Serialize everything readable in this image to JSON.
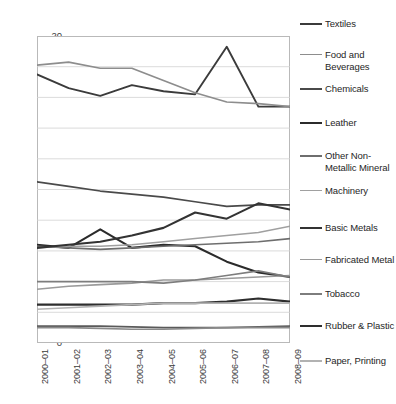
{
  "chart_data": {
    "type": "line",
    "title": "",
    "xlabel": "",
    "ylabel": "",
    "ylim": [
      0,
      20
    ],
    "ytick_step": 2,
    "grid": true,
    "legend_position": "right",
    "categories": [
      "2000–01",
      "2001–02",
      "2002–03",
      "2003–04",
      "2004–05",
      "2005–06",
      "2006–07",
      "2007–08",
      "2008–09"
    ],
    "yticks": [
      "0",
      "2",
      "4",
      "6",
      "8",
      "10",
      "12",
      "14",
      "16",
      "18",
      "20"
    ],
    "series": [
      {
        "name": "Textiles",
        "color": "#3b3b3b",
        "width": 1.9,
        "values": [
          17.5,
          16.6,
          16.1,
          16.8,
          16.4,
          16.2,
          19.3,
          15.4,
          15.4
        ]
      },
      {
        "name": "Food and Beverages",
        "color": "#8d8d8d",
        "width": 1.7,
        "values": [
          18.1,
          18.3,
          17.9,
          17.9,
          17.1,
          16.3,
          15.7,
          15.6,
          15.4
        ]
      },
      {
        "name": "Chemicals",
        "color": "#4a4a4a",
        "width": 1.7,
        "values": [
          10.5,
          10.2,
          9.9,
          9.7,
          9.5,
          9.2,
          8.9,
          9.0,
          9.0
        ]
      },
      {
        "name": "Leather",
        "color": "#2b2b2b",
        "width": 2.1,
        "values": [
          6.4,
          6.2,
          7.4,
          6.2,
          6.4,
          6.3,
          5.3,
          4.6,
          4.3
        ]
      },
      {
        "name": "Other Non-Metallic Mineral",
        "color": "#6e6e6e",
        "width": 1.6,
        "values": [
          6.3,
          6.2,
          6.1,
          6.2,
          6.3,
          6.4,
          6.5,
          6.6,
          6.8
        ]
      },
      {
        "name": "Machinery",
        "color": "#a0a0a0",
        "width": 1.5,
        "values": [
          6.2,
          6.3,
          6.3,
          6.4,
          6.6,
          6.8,
          7.0,
          7.2,
          7.6
        ]
      },
      {
        "name": "Basic Metals",
        "color": "#333333",
        "width": 2.1,
        "values": [
          6.2,
          6.4,
          6.6,
          7.0,
          7.5,
          8.5,
          8.1,
          9.1,
          8.7
        ]
      },
      {
        "name": "Fabricated Metal",
        "color": "#9a9a9a",
        "width": 1.6,
        "values": [
          3.5,
          3.7,
          3.8,
          3.9,
          4.1,
          4.1,
          4.2,
          4.3,
          4.4
        ]
      },
      {
        "name": "Tobacco",
        "color": "#7d7d7d",
        "width": 1.6,
        "values": [
          4.0,
          4.0,
          4.0,
          4.0,
          3.9,
          4.1,
          4.4,
          4.7,
          4.3
        ]
      },
      {
        "name": "Rubber & Plastic",
        "color": "#2e2e2e",
        "width": 2.2,
        "values": [
          2.5,
          2.5,
          2.5,
          2.5,
          2.6,
          2.6,
          2.7,
          2.9,
          2.7
        ]
      },
      {
        "name": "Paper, Printing",
        "color": "#b2b2b2",
        "width": 1.6,
        "values": [
          2.2,
          2.3,
          2.4,
          2.5,
          2.6,
          2.6,
          2.6,
          2.6,
          2.6
        ]
      },
      {
        "name": "Other 1",
        "color": "#5a5a5a",
        "width": 1.8,
        "values": [
          1.1,
          1.1,
          1.1,
          1.05,
          1.0,
          1.0,
          1.0,
          1.05,
          1.1
        ]
      },
      {
        "name": "Other 2",
        "color": "#8a8a8a",
        "width": 1.6,
        "values": [
          1.0,
          1.0,
          0.95,
          0.9,
          0.9,
          0.95,
          1.0,
          1.0,
          1.0
        ]
      }
    ],
    "legend_entries": [
      {
        "label": "Textiles",
        "color": "#3b3b3b",
        "width": 2.4,
        "top": 18
      },
      {
        "label": "Food and Beverages",
        "color": "#8d8d8d",
        "width": 1.8,
        "top": 49
      },
      {
        "label": "Chemicals",
        "color": "#4a4a4a",
        "width": 2.2,
        "top": 83
      },
      {
        "label": "Leather",
        "color": "#2b2b2b",
        "width": 2.6,
        "top": 117
      },
      {
        "label": "Other Non-Metallic Mineral",
        "color": "#6e6e6e",
        "width": 2.0,
        "top": 150
      },
      {
        "label": "Machinery",
        "color": "#a0a0a0",
        "width": 1.8,
        "top": 185
      },
      {
        "label": "Basic Metals",
        "color": "#333333",
        "width": 2.6,
        "top": 222
      },
      {
        "label": "Fabricated Metal",
        "color": "#9a9a9a",
        "width": 1.8,
        "top": 254
      },
      {
        "label": "Tobacco",
        "color": "#7d7d7d",
        "width": 2.2,
        "top": 288
      },
      {
        "label": "Rubber & Plastic",
        "color": "#2e2e2e",
        "width": 2.8,
        "top": 320
      },
      {
        "label": "Paper, Printing",
        "color": "#b2b2b2",
        "width": 2.0,
        "top": 355
      }
    ]
  }
}
